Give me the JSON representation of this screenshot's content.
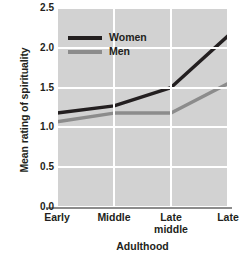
{
  "chart_data": {
    "type": "line",
    "title": "",
    "xlabel": "Adulthood",
    "ylabel": "Mean rating of spirituality",
    "categories": [
      "Early",
      "Middle",
      "Late middle",
      "Late"
    ],
    "category_lines": [
      [
        "Early"
      ],
      [
        "Middle"
      ],
      [
        "Late",
        "middle"
      ],
      [
        "Late"
      ]
    ],
    "yticks": [
      "0.0",
      "0.5",
      "1.0",
      "1.5",
      "2.0",
      "2.5"
    ],
    "ytick_values": [
      0.0,
      0.5,
      1.0,
      1.5,
      2.0,
      2.5
    ],
    "ylim": [
      0.0,
      2.5
    ],
    "grid": true,
    "legend_position": "upper-left-inside",
    "plot_background": "#d2d2d2",
    "gridline_color": "#ffffff",
    "series": [
      {
        "name": "Women",
        "color": "#231f20",
        "values": [
          1.18,
          1.27,
          1.5,
          2.15
        ]
      },
      {
        "name": "Men",
        "color": "#8c8c8c",
        "values": [
          1.07,
          1.18,
          1.18,
          1.55
        ]
      }
    ]
  }
}
